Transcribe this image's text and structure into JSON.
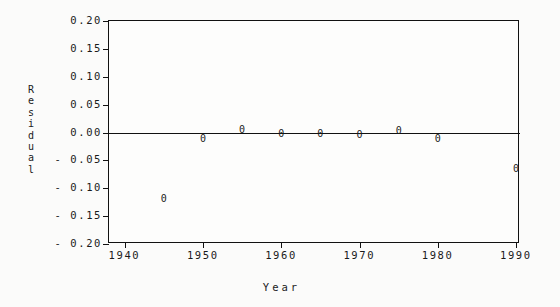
{
  "chart_data": {
    "type": "scatter",
    "title": "",
    "xlabel": "Year",
    "ylabel": "Residual",
    "ylabel_letters": [
      "R",
      "e",
      "s",
      "i",
      "d",
      "u",
      "a",
      "l"
    ],
    "xlim": [
      1938,
      1990.5
    ],
    "ylim": [
      -0.2,
      0.2
    ],
    "grid": false,
    "legend": "none",
    "marker_glyph": "0",
    "zero_reference_line": 0.0,
    "yticks": [
      0.2,
      0.15,
      0.1,
      0.05,
      0.0,
      -0.05,
      -0.1,
      -0.15,
      -0.2
    ],
    "ytick_labels": [
      "0.20",
      "0.15",
      "0.10",
      "0.05",
      "0.00",
      "-0.05",
      "-0.10",
      "-0.15",
      "-0.20"
    ],
    "xticks": [
      1940,
      1950,
      1960,
      1970,
      1980,
      1990
    ],
    "xtick_labels": [
      "1940",
      "1950",
      "1960",
      "1970",
      "1980",
      "1990"
    ],
    "x": [
      1945,
      1950,
      1955,
      1960,
      1965,
      1970,
      1975,
      1980,
      1990
    ],
    "y": [
      -0.12,
      -0.012,
      0.005,
      -0.003,
      -0.003,
      -0.004,
      0.003,
      -0.012,
      -0.065
    ],
    "points": [
      {
        "x": 1945,
        "y": -0.12
      },
      {
        "x": 1950,
        "y": -0.012
      },
      {
        "x": 1955,
        "y": 0.005
      },
      {
        "x": 1960,
        "y": -0.003
      },
      {
        "x": 1965,
        "y": -0.003
      },
      {
        "x": 1970,
        "y": -0.004
      },
      {
        "x": 1975,
        "y": 0.003
      },
      {
        "x": 1980,
        "y": -0.012
      },
      {
        "x": 1990,
        "y": -0.065
      }
    ],
    "colors": {
      "background": "#fbfbfa",
      "plot_background": "#fdfdfc",
      "axis": "#111111",
      "text": "#1a1a1a",
      "marker": "#1a1a1a"
    }
  }
}
